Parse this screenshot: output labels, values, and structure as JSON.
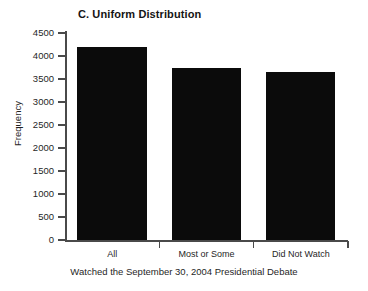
{
  "chart_data": {
    "type": "bar",
    "title": "C. Uniform Distribution",
    "xlabel": "Watched the September 30, 2004 Presidential Debate",
    "ylabel": "Frequency",
    "categories": [
      "All",
      "Most or Some",
      "Did Not Watch"
    ],
    "values": [
      4200,
      3740,
      3650
    ],
    "ylim": [
      0,
      4500
    ],
    "yticks": [
      0,
      500,
      1000,
      1500,
      2000,
      2500,
      3000,
      3500,
      4000,
      4500
    ],
    "ytick_labels": [
      "0",
      "500",
      "1000",
      "1500",
      "2000",
      "2500",
      "3000",
      "3500",
      "4000",
      "4500"
    ],
    "grid": false,
    "legend": false,
    "bar_color": "#0b0b0b",
    "axis_color": "#4a4a4a",
    "background": "#ffffff"
  }
}
